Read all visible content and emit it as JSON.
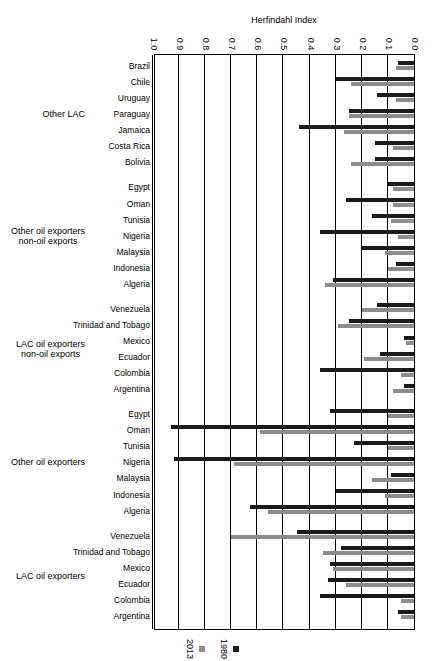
{
  "chart_data": {
    "type": "bar",
    "orientation": "horizontal",
    "title": "",
    "xlabel": "Herfindahl Index",
    "ylabel": "",
    "xlim": [
      0.0,
      1.0
    ],
    "xticks": [
      "0.0",
      "0.1",
      "0.2",
      "0.3",
      "0.4",
      "0.5",
      "0.6",
      "0.7",
      "0.8",
      "0.9",
      "1.0"
    ],
    "grid": true,
    "legend_position": "top",
    "legend": [
      {
        "name": "1980",
        "color": "#1a1a1a"
      },
      {
        "name": "2013",
        "color": "#8c8c8c"
      }
    ],
    "series": [
      {
        "name": "1980",
        "color": "#1a1a1a"
      },
      {
        "name": "2013",
        "color": "#8c8c8c"
      }
    ],
    "groups": [
      {
        "label": "LAC oil exporters",
        "categories": [
          "Argentina",
          "Colombia",
          "Ecuador",
          "Mexico",
          "Trinidad and Tobago",
          "Venezuela"
        ],
        "values_1980": [
          0.06,
          0.36,
          0.33,
          0.32,
          0.28,
          0.45
        ],
        "values_2013": [
          0.05,
          0.05,
          0.26,
          0.31,
          0.35,
          0.7
        ]
      },
      {
        "label": "Other oil exporters",
        "categories": [
          "Algeria",
          "Indonesia",
          "Malaysia",
          "Nigeria",
          "Tunisia",
          "Oman",
          "Egypt"
        ],
        "values_1980": [
          0.63,
          0.3,
          0.09,
          0.92,
          0.23,
          0.93,
          0.32
        ],
        "values_2013": [
          0.56,
          0.11,
          0.16,
          0.69,
          0.1,
          0.59,
          0.1
        ]
      },
      {
        "label": "LAC oil exporters\nnon-oil exports",
        "categories": [
          "Argentina",
          "Colombia",
          "Ecuador",
          "Mexico",
          "Trinidad and Tobago",
          "Venezuela"
        ],
        "values_1980": [
          0.04,
          0.36,
          0.13,
          0.04,
          0.25,
          0.14
        ],
        "values_2013": [
          0.08,
          0.05,
          0.19,
          0.03,
          0.29,
          0.2
        ]
      },
      {
        "label": "Other oil exporters\nnon-oil exports",
        "categories": [
          "Algeria",
          "Indonesia",
          "Malaysia",
          "Nigeria",
          "Tunisia",
          "Oman",
          "Egypt"
        ],
        "values_1980": [
          0.31,
          0.07,
          0.2,
          0.36,
          0.16,
          0.26,
          0.1
        ],
        "values_2013": [
          0.34,
          0.1,
          0.11,
          0.06,
          0.09,
          0.08,
          0.08
        ]
      },
      {
        "label": "Other LAC",
        "categories": [
          "Bolivia",
          "Costa Rica",
          "Jamaica",
          "Paraguay",
          "Uruguay",
          "Chile",
          "Brazil"
        ],
        "values_1980": [
          0.15,
          0.15,
          0.44,
          0.25,
          0.14,
          0.3,
          0.06
        ],
        "values_2013": [
          0.24,
          0.08,
          0.27,
          0.25,
          0.07,
          0.24,
          0.07
        ]
      }
    ]
  },
  "axis": {
    "title": "Herfindahl Index"
  },
  "legend": {
    "items": [
      {
        "label": "1980"
      },
      {
        "label": "2013"
      }
    ]
  }
}
